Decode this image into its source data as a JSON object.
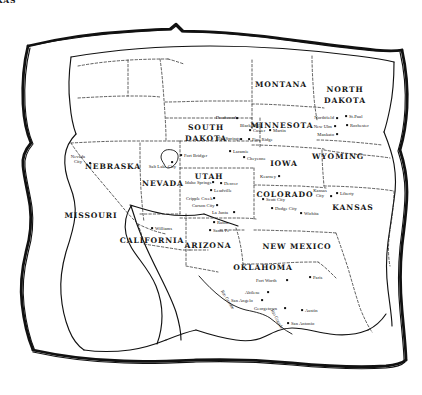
{
  "map": {
    "title": "Hand-drawn map of the Western and Central United States",
    "style": "torn-paper edge, dashed state borders, ink line art",
    "ink_color": "#111111",
    "paper_color": "#ffffff",
    "states": [
      {
        "name": "MONTANA",
        "lines": [
          "MONTANA"
        ],
        "x": 207,
        "y": 84
      },
      {
        "name": "NORTH DAKOTA",
        "lines": [
          "NORTH",
          "DAKOTA"
        ],
        "x": 281,
        "y": 84
      },
      {
        "name": "MINNESOTA",
        "lines": [
          "MINNESOTA"
        ],
        "x": 345,
        "y": 95
      },
      {
        "name": "SOUTH DAKOTA",
        "lines": [
          "SOUTH",
          "DAKOTA"
        ],
        "x": 282,
        "y": 125
      },
      {
        "name": "WYOMING",
        "lines": [
          "WYOMING"
        ],
        "x": 206,
        "y": 133
      },
      {
        "name": "IOWA",
        "lines": [
          "IOWA"
        ],
        "x": 338,
        "y": 156
      },
      {
        "name": "NEBRASKA",
        "lines": [
          "NEBRASKA"
        ],
        "x": 284,
        "y": 163
      },
      {
        "name": "NEVADA",
        "lines": [
          "NEVADA"
        ],
        "x": 113,
        "y": 166
      },
      {
        "name": "UTAH",
        "lines": [
          "UTAH"
        ],
        "x": 163,
        "y": 183
      },
      {
        "name": "COLORADO",
        "lines": [
          "COLORADO"
        ],
        "x": 209,
        "y": 176
      },
      {
        "name": "KANSAS",
        "lines": [
          "KANSAS"
        ],
        "x": 285,
        "y": 194
      },
      {
        "name": "MISSOURI",
        "lines": [
          "MISSOURI"
        ],
        "x": 353,
        "y": 207
      },
      {
        "name": "CALIFORNIA",
        "lines": [
          "CALIFORNIA"
        ],
        "x": 91,
        "y": 215
      },
      {
        "name": "ARIZONA",
        "lines": [
          "ARIZONA"
        ],
        "x": 152,
        "y": 240
      },
      {
        "name": "NEW MEXICO",
        "lines": [
          "NEW  MEXICO"
        ],
        "x": 208,
        "y": 245
      },
      {
        "name": "OKLAHOMA",
        "lines": [
          "OKLAHOMA"
        ],
        "x": 297,
        "y": 246
      },
      {
        "name": "TEXAS",
        "lines": [
          "TEXAS"
        ],
        "x": 263,
        "y": 267
      }
    ],
    "cities": [
      {
        "name": "Nevada City",
        "lines": [
          "Nevada",
          "City"
        ],
        "x": 78,
        "y": 159,
        "align": "c",
        "dot_x": 90,
        "dot_y": 163
      },
      {
        "name": "Salt Lake City",
        "lines": [
          "Salt Lake City"
        ],
        "x": 176,
        "y": 166,
        "align": "r",
        "dot_x": 172,
        "dot_y": 162
      },
      {
        "name": "Fort Bridger",
        "lines": [
          "Fort Bridger"
        ],
        "x": 184,
        "y": 155,
        "align": "l",
        "dot_x": 181,
        "dot_y": 155
      },
      {
        "name": "Deadwood",
        "lines": [
          "Deadwood"
        ],
        "x": 236,
        "y": 117,
        "align": "r",
        "dot_x": 237,
        "dot_y": 118
      },
      {
        "name": "Black Hills",
        "lines": [
          "Black Hills"
        ],
        "x": 240,
        "y": 125,
        "align": "l",
        "dot_x": -1,
        "dot_y": -1
      },
      {
        "name": "Custer",
        "lines": [
          "Custer"
        ],
        "x": 253,
        "y": 130,
        "align": "l",
        "dot_x": 250,
        "dot_y": 130
      },
      {
        "name": "Martin",
        "lines": [
          "Martin"
        ],
        "x": 273,
        "y": 130,
        "align": "l",
        "dot_x": 270,
        "dot_y": 130
      },
      {
        "name": "Hot Springs",
        "lines": [
          "Hot Springs"
        ],
        "x": 240,
        "y": 138,
        "align": "r",
        "dot_x": 241,
        "dot_y": 139
      },
      {
        "name": "Pine Ridge",
        "lines": [
          "Pine Ridge"
        ],
        "x": 252,
        "y": 139,
        "align": "l",
        "dot_x": 249,
        "dot_y": 139
      },
      {
        "name": "Laramie",
        "lines": [
          "Laramie"
        ],
        "x": 233,
        "y": 151,
        "align": "l",
        "dot_x": 230,
        "dot_y": 151
      },
      {
        "name": "Cheyenne",
        "lines": [
          "Cheyenne"
        ],
        "x": 247,
        "y": 158,
        "align": "l",
        "dot_x": 244,
        "dot_y": 157
      },
      {
        "name": "Northfield",
        "lines": [
          "Northfield"
        ],
        "x": 334,
        "y": 117,
        "align": "r",
        "dot_x": 337,
        "dot_y": 118
      },
      {
        "name": "St. Paul",
        "lines": [
          "St.Paul"
        ],
        "x": 349,
        "y": 116,
        "align": "l",
        "dot_x": 346,
        "dot_y": 116
      },
      {
        "name": "New Ulm",
        "lines": [
          "New Ulm"
        ],
        "x": 332,
        "y": 126,
        "align": "r",
        "dot_x": 335,
        "dot_y": 126
      },
      {
        "name": "Rochester",
        "lines": [
          "Rochester"
        ],
        "x": 350,
        "y": 125,
        "align": "l",
        "dot_x": 347,
        "dot_y": 125
      },
      {
        "name": "Mankato",
        "lines": [
          "Mankato"
        ],
        "x": 334,
        "y": 134,
        "align": "r",
        "dot_x": 337,
        "dot_y": 134
      },
      {
        "name": "Kearney",
        "lines": [
          "Kearney"
        ],
        "x": 276,
        "y": 176,
        "align": "r",
        "dot_x": 279,
        "dot_y": 176
      },
      {
        "name": "Idaho Springs",
        "lines": [
          "Idaho Springs"
        ],
        "x": 185,
        "y": 182,
        "align": "l",
        "dot_x": 213,
        "dot_y": 182
      },
      {
        "name": "Denver",
        "lines": [
          "Denver"
        ],
        "x": 224,
        "y": 183,
        "align": "l",
        "dot_x": 221,
        "dot_y": 183
      },
      {
        "name": "Leadville",
        "lines": [
          "Leadville"
        ],
        "x": 214,
        "y": 190,
        "align": "l",
        "dot_x": 211,
        "dot_y": 190
      },
      {
        "name": "Cripple Creek",
        "lines": [
          "Cripple Creek"
        ],
        "x": 186,
        "y": 198,
        "align": "l",
        "dot_x": 214,
        "dot_y": 198
      },
      {
        "name": "Carson City",
        "lines": [
          "Carson City"
        ],
        "x": 192,
        "y": 205,
        "align": "l",
        "dot_x": 217,
        "dot_y": 205
      },
      {
        "name": "La Junta",
        "lines": [
          "La Junta"
        ],
        "x": 212,
        "y": 212,
        "align": "l",
        "dot_x": 234,
        "dot_y": 212
      },
      {
        "name": "Scott City",
        "lines": [
          "Scott City"
        ],
        "x": 266,
        "y": 199,
        "align": "l",
        "dot_x": 263,
        "dot_y": 199
      },
      {
        "name": "Dodge City",
        "lines": [
          "Dodge City"
        ],
        "x": 275,
        "y": 208,
        "align": "l",
        "dot_x": 272,
        "dot_y": 208
      },
      {
        "name": "Wichita",
        "lines": [
          "Wichita"
        ],
        "x": 304,
        "y": 213,
        "align": "l",
        "dot_x": 301,
        "dot_y": 213
      },
      {
        "name": "Kansas City",
        "lines": [
          "Kansas",
          "City"
        ],
        "x": 320,
        "y": 193,
        "align": "c",
        "dot_x": 331,
        "dot_y": 196
      },
      {
        "name": "Liberty",
        "lines": [
          "Liberty"
        ],
        "x": 340,
        "y": 193,
        "align": "l",
        "dot_x": 337,
        "dot_y": 193
      },
      {
        "name": "Raton",
        "lines": [
          "Raton"
        ],
        "x": 217,
        "y": 222,
        "align": "l",
        "dot_x": 214,
        "dot_y": 222
      },
      {
        "name": "Santa Fe",
        "lines": [
          "Santa Fe"
        ],
        "x": 213,
        "y": 230,
        "align": "l",
        "dot_x": 210,
        "dot_y": 230
      },
      {
        "name": "Williams",
        "lines": [
          "Williams"
        ],
        "x": 155,
        "y": 228,
        "align": "l",
        "dot_x": 152,
        "dot_y": 228
      },
      {
        "name": "Fort Worth",
        "lines": [
          "Fort Worth"
        ],
        "x": 256,
        "y": 280,
        "align": "l",
        "dot_x": 287,
        "dot_y": 280
      },
      {
        "name": "Paris",
        "lines": [
          "Paris"
        ],
        "x": 313,
        "y": 277,
        "align": "l",
        "dot_x": 310,
        "dot_y": 277
      },
      {
        "name": "Abilene",
        "lines": [
          "Abilene"
        ],
        "x": 245,
        "y": 292,
        "align": "l",
        "dot_x": 268,
        "dot_y": 292
      },
      {
        "name": "San Angelo",
        "lines": [
          "San Angelo"
        ],
        "x": 231,
        "y": 300,
        "align": "l",
        "dot_x": 262,
        "dot_y": 300
      },
      {
        "name": "Georgetown",
        "lines": [
          "Georgetown"
        ],
        "x": 254,
        "y": 308,
        "align": "l",
        "dot_x": 285,
        "dot_y": 308
      },
      {
        "name": "Austin",
        "lines": [
          "Austin"
        ],
        "x": 305,
        "y": 310,
        "align": "l",
        "dot_x": 302,
        "dot_y": 310
      },
      {
        "name": "San Antonio",
        "lines": [
          "San Antonio"
        ],
        "x": 291,
        "y": 323,
        "align": "l",
        "dot_x": 288,
        "dot_y": 323
      }
    ],
    "rivers": [
      {
        "name": "Rio Grande",
        "x": 222,
        "y": 288,
        "rotate": 58
      },
      {
        "name": "Rio Grande",
        "x": 272,
        "y": 307,
        "rotate": 62
      }
    ]
  }
}
